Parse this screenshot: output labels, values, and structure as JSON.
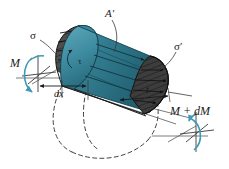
{
  "figure": {
    "width": 229,
    "height": 169,
    "background": "#ffffff"
  },
  "labels": {
    "sigma": "σ",
    "sigma_prime": "σ′",
    "area_prime": "A′",
    "tau": "τ",
    "moment_left": "M",
    "moment_right": "M + dM",
    "length": "dx",
    "thickness": "t"
  },
  "colors": {
    "teal_light": "#4a93a6",
    "teal_mid": "#2f7e93",
    "teal_dark": "#1d5a6b",
    "teal_deep": "#17414e",
    "moment_arrow": "#3f9ab4",
    "hatch_dark": "#4a4a4a",
    "hatch_darker": "#2e2e2e",
    "outline": "#1a1a1a",
    "dashed": "#2a2a2a",
    "axis": "#555555"
  },
  "elements": {
    "left_face_stress_name": "normal-stress-sigma-distribution",
    "right_face_stress_name": "normal-stress-sigma-prime-distribution",
    "top_shaded_area_name": "shaded-area-A-prime",
    "shear_plane_name": "shear-stress-plane-tau",
    "hidden_outline_name": "hidden-cross-section-dashed",
    "left_moment_name": "moment-M-arrow",
    "right_moment_name": "moment-M-plus-dM-arrow",
    "dx_dimension_name": "dx-dimension-line",
    "t_dimension_name": "t-dimension-line"
  }
}
